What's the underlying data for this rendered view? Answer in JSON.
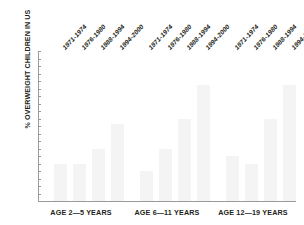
{
  "chart_data": {
    "type": "bar",
    "title": "",
    "subtitle": "",
    "xlabel": "",
    "ylabel": "% OVERWEIGHT CHILDREN IN US",
    "ylim": [
      0,
      20
    ],
    "ytick_step": 1,
    "yticks": [
      "20",
      "19",
      "18",
      "17",
      "16",
      "15",
      "14",
      "13",
      "12",
      "11",
      "10",
      "9",
      "8",
      "7",
      "6",
      "5",
      "4",
      "3",
      "2",
      "1",
      "0"
    ],
    "grid": false,
    "legend_position": "none",
    "group_axis_labels": [
      "AGE 2—5 YEARS",
      "AGE 6—11 YEARS",
      "AGE 12—19 YEARS"
    ],
    "categories": [
      "1971-1974",
      "1976-1980",
      "1988-1994",
      "1994-2000"
    ],
    "groups": [
      {
        "name": "AGE 2—5 YEARS",
        "periods": [
          "1971-1974",
          "1976-1980",
          "1988-1994",
          "1994-2000"
        ],
        "values": [
          5,
          5,
          7,
          10.3
        ]
      },
      {
        "name": "AGE 6—11 YEARS",
        "periods": [
          "1971-1974",
          "1976-1980",
          "1988-1994",
          "1994-2000"
        ],
        "values": [
          4,
          7,
          11,
          15.5
        ]
      },
      {
        "name": "AGE 12—19 YEARS",
        "periods": [
          "1971-1974",
          "1976-1980",
          "1988-1994",
          "1994-2000"
        ],
        "values": [
          6,
          5,
          11,
          15.5
        ]
      }
    ],
    "colors": {
      "bar_fill": "#f4f4f4",
      "axis": "#9a9a9a",
      "text": "#231f20",
      "background": "#ffffff"
    }
  }
}
